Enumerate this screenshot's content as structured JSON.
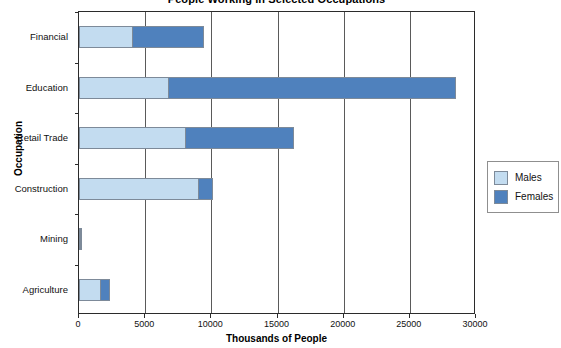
{
  "chart_data": {
    "type": "bar",
    "orientation": "horizontal",
    "stacked": true,
    "title": "People Working in Selected Occupations",
    "xlabel": "Thousands of People",
    "ylabel": "Occupation",
    "categories": [
      "Agriculture",
      "Mining",
      "Construction",
      "Retail Trade",
      "Education",
      "Financial"
    ],
    "series": [
      {
        "name": "Males",
        "color": "#c3dcf0",
        "values": [
          1650,
          180,
          9100,
          8100,
          6800,
          4100
        ]
      },
      {
        "name": "Females",
        "color": "#4f81bd",
        "values": [
          750,
          150,
          1100,
          8200,
          21800,
          5400
        ]
      }
    ],
    "xlim": [
      0,
      30000
    ],
    "xticks": [
      0,
      5000,
      10000,
      15000,
      20000,
      25000,
      30000
    ],
    "xtick_labels": [
      "0",
      "5000",
      "10000",
      "15000",
      "20000",
      "25000",
      "30000"
    ],
    "grid": "vertical",
    "legend_position": "right"
  },
  "legend": {
    "entries": [
      {
        "label": "Males",
        "color": "#c3dcf0"
      },
      {
        "label": "Females",
        "color": "#4f81bd"
      }
    ]
  }
}
